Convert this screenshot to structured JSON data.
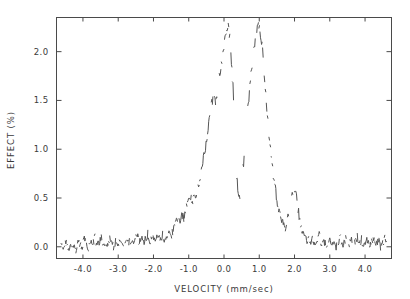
{
  "chart_data": {
    "type": "line",
    "title": "",
    "xlabel": "VELOCITY (mm/sec)",
    "ylabel": "EFFECT (%)",
    "xlim": [
      -4.75,
      4.75
    ],
    "ylim": [
      2.35,
      -0.12
    ],
    "y_inverted": true,
    "grid": false,
    "legend": "none",
    "xticks": [
      -4.0,
      -3.0,
      -2.0,
      -1.0,
      0.0,
      1.0,
      2.0,
      3.0,
      4.0
    ],
    "xtick_labels": [
      "-4.0",
      "-3.0",
      "-2.0",
      "-1.0",
      "0.0",
      "1.0",
      "2.0",
      "3.0",
      "4.0"
    ],
    "yticks": [
      0.0,
      0.5,
      1.0,
      1.5,
      2.0
    ],
    "ytick_labels": [
      "0.0",
      "0.5",
      "1.0",
      "1.5",
      "2.0"
    ],
    "series": [
      {
        "name": "absorption",
        "render": "dashed-noisy-points",
        "x": [
          -4.62,
          -4.56,
          -4.5,
          -4.44,
          -4.38,
          -4.32,
          -4.26,
          -4.2,
          -4.14,
          -4.08,
          -4.02,
          -3.96,
          -3.9,
          -3.84,
          -3.78,
          -3.72,
          -3.66,
          -3.6,
          -3.54,
          -3.48,
          -3.42,
          -3.36,
          -3.3,
          -3.24,
          -3.18,
          -3.12,
          -3.06,
          -3.0,
          -2.94,
          -2.88,
          -2.82,
          -2.76,
          -2.7,
          -2.64,
          -2.58,
          -2.52,
          -2.46,
          -2.4,
          -2.34,
          -2.28,
          -2.22,
          -2.16,
          -2.1,
          -2.04,
          -1.98,
          -1.92,
          -1.86,
          -1.8,
          -1.74,
          -1.68,
          -1.62,
          -1.56,
          -1.5,
          -1.44,
          -1.38,
          -1.32,
          -1.26,
          -1.2,
          -1.14,
          -1.08,
          -1.02,
          -0.96,
          -0.9,
          -0.84,
          -0.78,
          -0.72,
          -0.66,
          -0.6,
          -0.54,
          -0.48,
          -0.42,
          -0.36,
          -0.3,
          -0.24,
          -0.18,
          -0.12,
          -0.06,
          0.0,
          0.06,
          0.12,
          0.18,
          0.24,
          0.3,
          0.36,
          0.42,
          0.48,
          0.54,
          0.6,
          0.66,
          0.72,
          0.78,
          0.84,
          0.9,
          0.96,
          1.02,
          1.08,
          1.14,
          1.2,
          1.26,
          1.32,
          1.38,
          1.44,
          1.5,
          1.56,
          1.62,
          1.68,
          1.74,
          1.8,
          1.86,
          1.92,
          1.98,
          2.04,
          2.1,
          2.16,
          2.22,
          2.28,
          2.34,
          2.4,
          2.46,
          2.52,
          2.58,
          2.64,
          2.7,
          2.76,
          2.82,
          2.88,
          2.94,
          3.0,
          3.06,
          3.12,
          3.18,
          3.24,
          3.3,
          3.36,
          3.42,
          3.48,
          3.54,
          3.6,
          3.66,
          3.72,
          3.78,
          3.84,
          3.9,
          3.96,
          4.02,
          4.08,
          4.14,
          4.2,
          4.26,
          4.32,
          4.38,
          4.44,
          4.5,
          4.56,
          4.62
        ],
        "y": [
          0.02,
          -0.02,
          0.05,
          0.0,
          -0.03,
          0.06,
          0.01,
          -0.02,
          0.07,
          0.02,
          0.0,
          0.08,
          0.02,
          -0.01,
          0.06,
          0.03,
          0.09,
          0.01,
          0.05,
          0.1,
          0.02,
          0.06,
          0.01,
          0.08,
          0.03,
          0.0,
          0.07,
          0.04,
          0.09,
          0.02,
          0.06,
          0.11,
          0.04,
          0.08,
          0.02,
          0.07,
          0.12,
          0.05,
          0.09,
          0.03,
          0.08,
          0.13,
          0.06,
          0.1,
          0.05,
          0.11,
          0.15,
          0.08,
          0.12,
          0.07,
          0.13,
          0.18,
          0.11,
          0.16,
          0.22,
          0.3,
          0.26,
          0.33,
          0.29,
          0.38,
          0.46,
          0.52,
          0.45,
          0.58,
          0.5,
          0.62,
          0.74,
          0.86,
          0.99,
          1.14,
          1.3,
          1.44,
          1.55,
          1.48,
          1.62,
          1.78,
          1.92,
          2.05,
          2.18,
          2.25,
          2.1,
          1.75,
          1.2,
          0.72,
          0.48,
          0.55,
          0.78,
          1.05,
          1.32,
          1.58,
          1.8,
          2.0,
          2.18,
          2.3,
          2.22,
          2.05,
          1.78,
          1.5,
          1.22,
          0.98,
          0.78,
          0.62,
          0.48,
          0.38,
          0.3,
          0.24,
          0.2,
          0.26,
          0.38,
          0.52,
          0.62,
          0.55,
          0.4,
          0.26,
          0.16,
          0.1,
          0.06,
          0.11,
          0.05,
          0.09,
          0.02,
          0.07,
          0.12,
          0.04,
          0.08,
          0.01,
          0.06,
          0.1,
          0.03,
          0.07,
          0.0,
          0.05,
          0.09,
          0.02,
          0.06,
          0.11,
          0.03,
          0.08,
          0.01,
          0.05,
          0.1,
          0.02,
          0.07,
          0.0,
          0.04,
          0.09,
          0.01,
          0.06,
          0.11,
          0.03,
          0.07,
          0.0,
          0.05,
          0.08,
          0.02
        ]
      }
    ]
  }
}
